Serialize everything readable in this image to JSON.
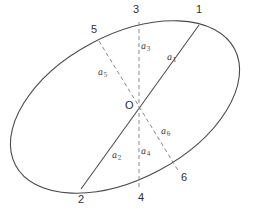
{
  "figure": {
    "center_label": "O",
    "caption": "",
    "colors": {
      "ellipse_stroke": "#4a4a4a",
      "solid_chord_stroke": "#4a4a4a",
      "dashed_chord_stroke": "#8a8a8a",
      "label_text": "#2f2f2f",
      "background": "#ffffff"
    },
    "ellipse": {
      "center_x": 125,
      "center_y": 107,
      "semi_major": 124,
      "semi_minor": 72,
      "rotation_deg": -28
    },
    "center_point": {
      "x": 139,
      "y": 107
    },
    "points": [
      {
        "id": "1",
        "label": "1",
        "x": 199,
        "y": 25,
        "label_x": 196,
        "label_y": 5
      },
      {
        "id": "2",
        "label": "2",
        "x": 81,
        "y": 189,
        "label_x": 80,
        "label_y": 193
      },
      {
        "id": "3",
        "label": "3",
        "x": 139,
        "y": 22,
        "label_x": 134,
        "label_y": 6
      },
      {
        "id": "4",
        "label": "4",
        "x": 139,
        "y": 190,
        "label_x": 138,
        "label_y": 192
      },
      {
        "id": "5",
        "label": "5",
        "x": 99,
        "y": 41,
        "label_x": 92,
        "label_y": 25
      },
      {
        "id": "6",
        "label": "6",
        "x": 179,
        "y": 172,
        "label_x": 180,
        "label_y": 172
      }
    ],
    "chords": [
      {
        "id": "chord-1-2",
        "from": "1",
        "to": "2",
        "style": "solid"
      },
      {
        "id": "chord-3-4",
        "from": "3",
        "to": "4",
        "style": "dashed"
      },
      {
        "id": "chord-5-6",
        "from": "5",
        "to": "6",
        "style": "dashed"
      }
    ],
    "segment_labels": [
      {
        "id": "a1",
        "base": "a",
        "sub": "1",
        "x": 167,
        "y": 56
      },
      {
        "id": "a2",
        "base": "a",
        "sub": "2",
        "x": 112,
        "y": 152
      },
      {
        "id": "a3",
        "base": "a",
        "sub": "3",
        "x": 141,
        "y": 44
      },
      {
        "id": "a4",
        "base": "a",
        "sub": "4",
        "x": 141,
        "y": 148
      },
      {
        "id": "a5",
        "base": "a",
        "sub": "5",
        "x": 99,
        "y": 69
      },
      {
        "id": "a6",
        "base": "a",
        "sub": "6",
        "x": 161,
        "y": 128
      }
    ],
    "center_label_pos": {
      "x": 125,
      "y": 101
    }
  }
}
